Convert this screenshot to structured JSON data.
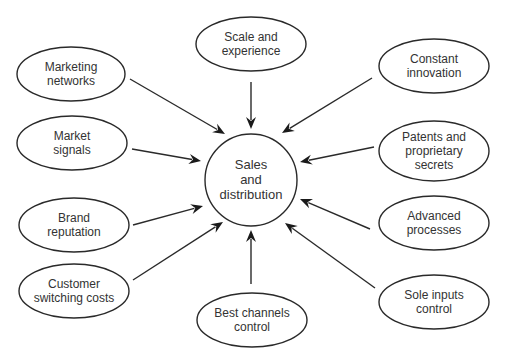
{
  "diagram": {
    "center": {
      "lines": [
        "Sales",
        "and",
        "distribution"
      ],
      "cx": 251,
      "cy": 180,
      "r": 46
    },
    "nodes": [
      {
        "id": "marketing-networks",
        "lines": [
          "Marketing",
          "networks"
        ],
        "cx": 71,
        "cy": 74,
        "rx": 54,
        "ry": 27,
        "arrow": [
          130,
          79,
          225,
          134
        ]
      },
      {
        "id": "scale-and-experience",
        "lines": [
          "Scale and",
          "experience"
        ],
        "cx": 251,
        "cy": 44,
        "rx": 55,
        "ry": 27,
        "arrow": [
          251,
          82,
          251,
          129
        ]
      },
      {
        "id": "constant-innovation",
        "lines": [
          "Constant",
          "innovation"
        ],
        "cx": 434,
        "cy": 66,
        "rx": 55,
        "ry": 27,
        "arrow": [
          372,
          78,
          282,
          133
        ]
      },
      {
        "id": "market-signals",
        "lines": [
          "Market",
          "signals"
        ],
        "cx": 72,
        "cy": 143,
        "rx": 55,
        "ry": 27,
        "arrow": [
          132,
          149,
          201,
          161
        ]
      },
      {
        "id": "patents-and-proprietary-secrets",
        "lines": [
          "Patents and",
          "proprietary",
          "secrets"
        ],
        "cx": 434,
        "cy": 151,
        "rx": 55,
        "ry": 30,
        "arrow": [
          374,
          147,
          300,
          162
        ]
      },
      {
        "id": "brand-reputation",
        "lines": [
          "Brand",
          "reputation"
        ],
        "cx": 74,
        "cy": 225,
        "rx": 55,
        "ry": 27,
        "arrow": [
          133,
          225,
          203,
          206
        ]
      },
      {
        "id": "advanced-processes",
        "lines": [
          "Advanced",
          "processes"
        ],
        "cx": 434,
        "cy": 223,
        "rx": 55,
        "ry": 27,
        "arrow": [
          370,
          229,
          300,
          199
        ]
      },
      {
        "id": "customer-switching-costs",
        "lines": [
          "Customer",
          "switching costs"
        ],
        "cx": 74,
        "cy": 291,
        "rx": 55,
        "ry": 27,
        "arrow": [
          133,
          280,
          223,
          222
        ]
      },
      {
        "id": "best-channels-control",
        "lines": [
          "Best channels",
          "control"
        ],
        "cx": 252,
        "cy": 320,
        "rx": 55,
        "ry": 27,
        "arrow": [
          251,
          284,
          251,
          230
        ]
      },
      {
        "id": "sole-inputs-control",
        "lines": [
          "Sole inputs",
          "control"
        ],
        "cx": 434,
        "cy": 302,
        "rx": 55,
        "ry": 27,
        "arrow": [
          375,
          288,
          285,
          223
        ]
      }
    ]
  }
}
